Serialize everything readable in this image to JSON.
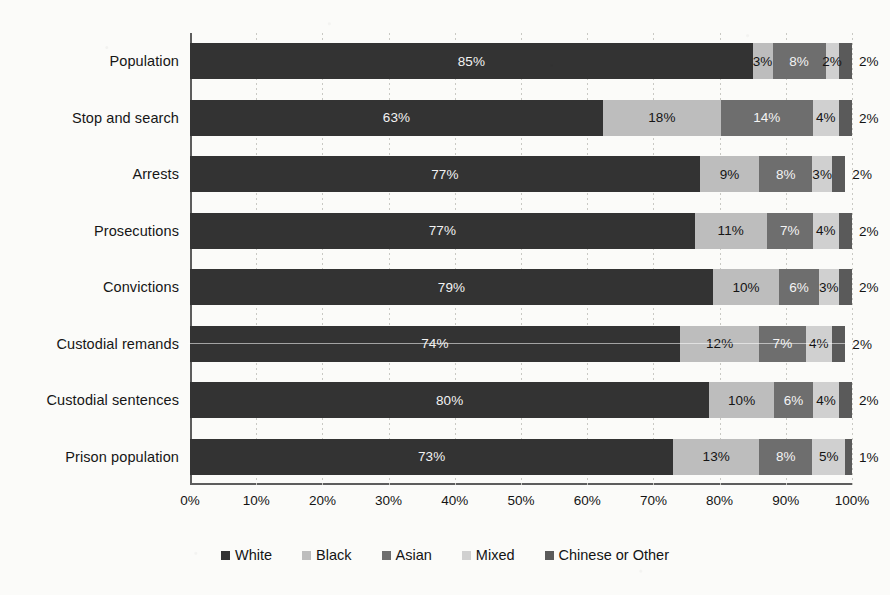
{
  "chart_data": {
    "type": "bar",
    "orientation": "horizontal",
    "stacked": true,
    "stack_mode": "percent",
    "title": "",
    "subtitle": "",
    "xlabel": "",
    "ylabel": "",
    "xlim": [
      0,
      100
    ],
    "xticks": [
      "0%",
      "10%",
      "20%",
      "30%",
      "40%",
      "50%",
      "60%",
      "70%",
      "80%",
      "90%",
      "100%"
    ],
    "xtick_values": [
      0,
      10,
      20,
      30,
      40,
      50,
      60,
      70,
      80,
      90,
      100
    ],
    "grid": true,
    "grid_axis": "x",
    "legend_position": "bottom",
    "categories": [
      "Population",
      "Stop and search",
      "Arrests",
      "Prosecutions",
      "Convictions",
      "Custodial remands",
      "Custodial sentences",
      "Prison population"
    ],
    "series": [
      {
        "name": "White",
        "color": "#333333",
        "values": [
          85,
          63,
          77,
          77,
          79,
          74,
          80,
          73
        ],
        "labels": [
          "85%",
          "63%",
          "77%",
          "77%",
          "79%",
          "74%",
          "80%",
          "73%"
        ]
      },
      {
        "name": "Black",
        "color": "#bdbdbd",
        "values": [
          3,
          18,
          9,
          11,
          10,
          12,
          10,
          13
        ],
        "labels": [
          "3%",
          "18%",
          "9%",
          "11%",
          "10%",
          "12%",
          "10%",
          "13%"
        ]
      },
      {
        "name": "Asian",
        "color": "#6e6e6e",
        "values": [
          8,
          14,
          8,
          7,
          6,
          7,
          6,
          8
        ],
        "labels": [
          "8%",
          "14%",
          "8%",
          "7%",
          "6%",
          "7%",
          "6%",
          "8%"
        ]
      },
      {
        "name": "Mixed",
        "color": "#d0d0d0",
        "values": [
          2,
          4,
          3,
          4,
          3,
          4,
          4,
          5
        ],
        "labels": [
          "2%",
          "4%",
          "3%",
          "4%",
          "3%",
          "4%",
          "4%",
          "5%"
        ]
      },
      {
        "name": "Chinese or Other",
        "color": "#5a5a5a",
        "values": [
          2,
          2,
          2,
          2,
          2,
          2,
          2,
          1
        ],
        "labels": [
          "2%",
          "2%",
          "2%",
          "2%",
          "2%",
          "2%",
          "2%",
          "1%"
        ]
      }
    ]
  },
  "legend": {
    "items": [
      {
        "label": "White",
        "color": "#333333"
      },
      {
        "label": "Black",
        "color": "#bdbdbd"
      },
      {
        "label": "Asian",
        "color": "#6e6e6e"
      },
      {
        "label": "Mixed",
        "color": "#d0d0d0"
      },
      {
        "label": "Chinese or Other",
        "color": "#5a5a5a"
      }
    ]
  }
}
